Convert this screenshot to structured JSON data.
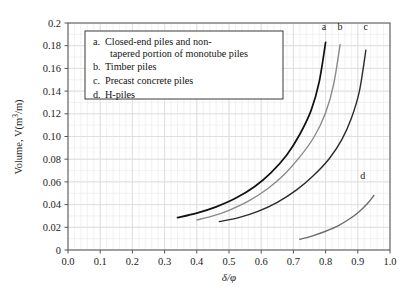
{
  "chart_data": {
    "type": "line",
    "title": "",
    "xlabel": "δ/φ",
    "ylabel": "Volume, V(m³/m)",
    "xlim": [
      0.0,
      1.0
    ],
    "ylim": [
      0.0,
      0.2
    ],
    "grid": true,
    "x_ticks": [
      "0.0",
      "0.1",
      "0.2",
      "0.3",
      "0.4",
      "0.5",
      "0.6",
      "0.7",
      "0.8",
      "0.9",
      "1.0"
    ],
    "x_tick_values": [
      0.0,
      0.1,
      0.2,
      0.3,
      0.4,
      0.5,
      0.6,
      0.7,
      0.8,
      0.9,
      1.0
    ],
    "y_ticks": [
      "0",
      "0.02",
      "0.04",
      "0.06",
      "0.08",
      "0.10",
      "0.12",
      "0.14",
      "0.16",
      "0.18",
      "0.2"
    ],
    "y_tick_values": [
      0.0,
      0.02,
      0.04,
      0.06,
      0.08,
      0.1,
      0.12,
      0.14,
      0.16,
      0.18,
      0.2
    ],
    "legend_position": "top-left",
    "series": [
      {
        "name": "a",
        "label": "Closed-end piles and non-tapered portion of monotube piles",
        "color": "#111111",
        "tag": "a",
        "tag_x": 0.795,
        "tag_y": 0.1935,
        "x": [
          0.34,
          0.4,
          0.46,
          0.52,
          0.58,
          0.63,
          0.68,
          0.72,
          0.755,
          0.78,
          0.8
        ],
        "y": [
          0.0285,
          0.0325,
          0.038,
          0.0455,
          0.056,
          0.068,
          0.084,
          0.102,
          0.123,
          0.148,
          0.183
        ]
      },
      {
        "name": "b",
        "label": "Timber piles",
        "color": "#8a8a8a",
        "tag": "b",
        "tag_x": 0.845,
        "tag_y": 0.1935,
        "x": [
          0.4,
          0.45,
          0.5,
          0.56,
          0.62,
          0.67,
          0.72,
          0.765,
          0.8,
          0.825,
          0.845
        ],
        "y": [
          0.0265,
          0.03,
          0.035,
          0.043,
          0.054,
          0.066,
          0.082,
          0.1,
          0.121,
          0.146,
          0.181
        ]
      },
      {
        "name": "c",
        "label": "Precast concrete piles",
        "color": "#2b2b2b",
        "tag": "c",
        "tag_x": 0.925,
        "tag_y": 0.1935,
        "x": [
          0.47,
          0.53,
          0.59,
          0.65,
          0.71,
          0.76,
          0.81,
          0.85,
          0.88,
          0.905,
          0.925
        ],
        "y": [
          0.025,
          0.0285,
          0.034,
          0.042,
          0.053,
          0.065,
          0.08,
          0.097,
          0.116,
          0.14,
          0.176
        ]
      },
      {
        "name": "d",
        "label": "H-piles",
        "color": "#6b6b6b",
        "tag": "d",
        "tag_x": 0.915,
        "tag_y": 0.0625,
        "x": [
          0.72,
          0.76,
          0.8,
          0.84,
          0.875,
          0.905,
          0.93,
          0.95
        ],
        "y": [
          0.0095,
          0.0125,
          0.0165,
          0.0215,
          0.0275,
          0.034,
          0.041,
          0.048
        ]
      }
    ],
    "legend_entries": [
      {
        "marker": "a.",
        "lines": [
          "Closed-end piles and non-",
          "tapered portion of monotube piles"
        ]
      },
      {
        "marker": "b.",
        "lines": [
          "Timber piles"
        ]
      },
      {
        "marker": "c.",
        "lines": [
          "Precast concrete piles"
        ]
      },
      {
        "marker": "d.",
        "lines": [
          "H-piles"
        ]
      }
    ]
  }
}
